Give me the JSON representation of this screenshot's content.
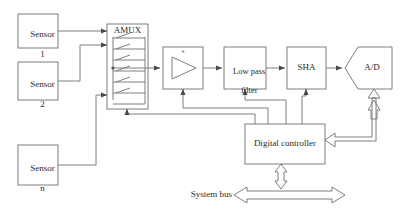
{
  "diagram": {
    "background_color": "#ffffff",
    "line_color": "#6f6f6f",
    "text_color": "#2b2b2b",
    "blocks": {
      "sensor1": {
        "label_line1": "Sensor",
        "label_line2": "1"
      },
      "sensor2": {
        "label_line1": "Sensor",
        "label_line2": "2"
      },
      "sensorn": {
        "label_line1": "Sensor",
        "label_line2": "n"
      },
      "amux": {
        "label": "AMUX",
        "switch_rows": 6
      },
      "amplifier": {
        "label": "",
        "polarity_mark": "+"
      },
      "lowpass": {
        "label_line1": "Low pass",
        "label_line2": "filter"
      },
      "sha": {
        "label": "SHA"
      },
      "adc": {
        "label": "A/D"
      },
      "controller": {
        "label": "Digital controller"
      }
    },
    "bus": {
      "label": "System bus"
    }
  }
}
